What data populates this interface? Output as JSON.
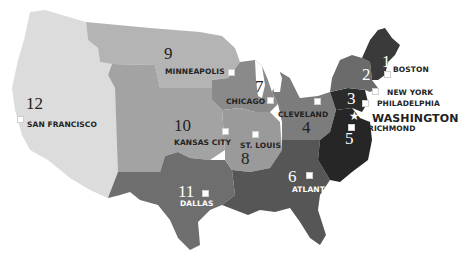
{
  "map": {
    "title": "Federal Reserve Districts",
    "districts": [
      {
        "number": "1",
        "city": "BOSTON",
        "color": "#3a3a3a"
      },
      {
        "number": "2",
        "city": "NEW YORK",
        "color": "#6b6b6b"
      },
      {
        "number": "3",
        "city": "PHILADELPHIA",
        "color": "#2b2b2b"
      },
      {
        "number": "4",
        "city": "CLEVELAND",
        "color": "#7c7c7c"
      },
      {
        "number": "5",
        "city": "RICHMOND",
        "color": "#262626"
      },
      {
        "number": "6",
        "city": "ATLANTA",
        "color": "#565656"
      },
      {
        "number": "7",
        "city": "CHICAGO",
        "color": "#8a8a8a"
      },
      {
        "number": "8",
        "city": "ST. LOUIS",
        "color": "#9a9a9a"
      },
      {
        "number": "9",
        "city": "MINNEAPOLIS",
        "color": "#b4b4b4"
      },
      {
        "number": "10",
        "city": "KANSAS CITY",
        "color": "#a3a3a3"
      },
      {
        "number": "11",
        "city": "DALLAS",
        "color": "#6e6e6e"
      },
      {
        "number": "12",
        "city": "SAN FRANCISCO",
        "color": "#dcdcdc"
      }
    ],
    "capital": {
      "label": "WASHINGTON",
      "icon": "star-icon"
    }
  }
}
